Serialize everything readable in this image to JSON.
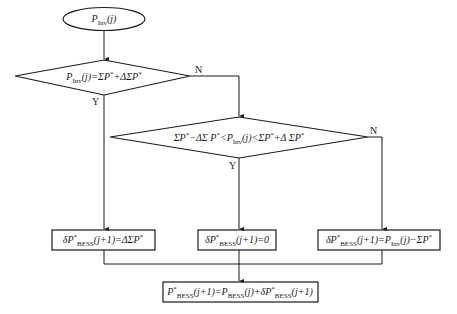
{
  "diagram": {
    "type": "flowchart",
    "nodes": {
      "start": {
        "shape": "ellipse",
        "text": "P_Inv(j)",
        "base": "P",
        "sub": "Inv",
        "tail": "(j)"
      },
      "decision1": {
        "shape": "diamond",
        "text": "P_Inv(j)=ΣP*+ΔΣP*",
        "parts": {
          "a": "P",
          "a_sub": "Inv",
          "b": "(j)=ΣP",
          "b_sup": "*",
          "c": "+ΔΣP",
          "c_sup": "*"
        }
      },
      "decision2": {
        "shape": "diamond",
        "text": "ΣP*−ΔΣ P*<P_Inv(j)<ΣP*+Δ ΣP*",
        "parts": {
          "a": "ΣP",
          "a_sup": "*",
          "b": "−ΔΣ P",
          "b_sup": "*",
          "c": "<P",
          "c_sub": "Inv",
          "d": "(j)<ΣP",
          "d_sup": "*",
          "e": "+Δ ΣP",
          "e_sup": "*"
        }
      },
      "box1": {
        "shape": "rect",
        "text": "δP*_BESS(j+1)=ΔΣP*",
        "parts": {
          "a": "δP",
          "a_sup": "*",
          "a_sub": "BESS",
          "b": "(j+1)=ΔΣP",
          "b_sup": "*"
        }
      },
      "box2": {
        "shape": "rect",
        "text": "δP*_BESS(j+1)=0",
        "parts": {
          "a": "δP",
          "a_sup": "*",
          "a_sub": "BESS",
          "b": "(j+1)=0"
        }
      },
      "box3": {
        "shape": "rect",
        "text": "δP*_BESS(j+1)=P_Inv(j)−ΣP*",
        "parts": {
          "a": "δP",
          "a_sup": "*",
          "a_sub": "BESS",
          "b": "(j+1)=P",
          "b_sub": "Inv",
          "c": "(j)−ΣP",
          "c_sup": "*"
        }
      },
      "box4": {
        "shape": "rect",
        "text": "P*_BESS(j+1)=P_BESS(j)+δP*_BESS(j+1)",
        "parts": {
          "a": "P",
          "a_sup": "*",
          "a_sub": "BESS",
          "b": "(j+1)=P",
          "b_sub": "BESS",
          "c": "(j)+δP",
          "c_sup": "*",
          "c_sub": "BESS",
          "d": "(j+1)"
        }
      }
    },
    "edges": [
      {
        "from": "start",
        "to": "decision1",
        "label": ""
      },
      {
        "from": "decision1",
        "to": "box1",
        "label": "Y"
      },
      {
        "from": "decision1",
        "to": "decision2",
        "label": "N"
      },
      {
        "from": "decision2",
        "to": "box2",
        "label": "Y"
      },
      {
        "from": "decision2",
        "to": "box3",
        "label": "N"
      },
      {
        "from": "box1",
        "to": "box4",
        "label": ""
      },
      {
        "from": "box2",
        "to": "box4",
        "label": ""
      },
      {
        "from": "box3",
        "to": "box4",
        "label": ""
      }
    ],
    "labels": {
      "yes": "Y",
      "no": "N"
    },
    "colors": {
      "stroke": "#1a1a1a",
      "background": "#ffffff"
    }
  }
}
